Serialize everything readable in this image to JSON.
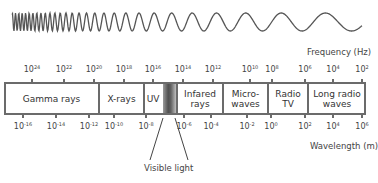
{
  "title_partial": "",
  "frequency_axis": {
    "label": "Frequency (Hz)",
    "ticks": [
      {
        "base": "10",
        "exp": "24",
        "x": 32
      },
      {
        "base": "10",
        "exp": "22",
        "x": 64
      },
      {
        "base": "10",
        "exp": "20",
        "x": 94
      },
      {
        "base": "10",
        "exp": "18",
        "x": 124
      },
      {
        "base": "10",
        "exp": "16",
        "x": 153
      },
      {
        "base": "10",
        "exp": "14",
        "x": 183
      },
      {
        "base": "10",
        "exp": "12",
        "x": 213
      },
      {
        "base": "10",
        "exp": "10",
        "x": 250
      },
      {
        "base": "10",
        "exp": "8",
        "x": 272
      },
      {
        "base": "10",
        "exp": "6",
        "x": 305
      },
      {
        "base": "10",
        "exp": "4",
        "x": 333
      },
      {
        "base": "10",
        "exp": "2",
        "x": 362
      }
    ]
  },
  "wavelength_axis": {
    "label": "Wavelength (m)",
    "ticks": [
      {
        "base": "10",
        "exp": "-16",
        "x": 23
      },
      {
        "base": "10",
        "exp": "-14",
        "x": 56
      },
      {
        "base": "10",
        "exp": "-12",
        "x": 89
      },
      {
        "base": "10",
        "exp": "-10",
        "x": 114
      },
      {
        "base": "10",
        "exp": "-8",
        "x": 146
      },
      {
        "base": "10",
        "exp": "-6",
        "x": 184
      },
      {
        "base": "10",
        "exp": "-4",
        "x": 211
      },
      {
        "base": "10",
        "exp": "-2",
        "x": 247
      },
      {
        "base": "10",
        "exp": "0",
        "x": 271
      },
      {
        "base": "10",
        "exp": "2",
        "x": 305
      },
      {
        "base": "10",
        "exp": "4",
        "x": 333
      },
      {
        "base": "10",
        "exp": "6",
        "x": 362
      }
    ]
  },
  "bands": [
    {
      "label": "Gamma rays",
      "left": 4,
      "right": 99
    },
    {
      "label": "X-rays",
      "left": 99,
      "right": 144
    },
    {
      "label": "UV",
      "left": 144,
      "right": 162
    },
    {
      "label": "Visible light",
      "left": 162,
      "right": 177
    },
    {
      "label": "Infared\nrays",
      "left": 177,
      "right": 223
    },
    {
      "label": "Micro-\nwaves",
      "left": 223,
      "right": 268
    },
    {
      "label": "Radio\nTV",
      "left": 268,
      "right": 308
    },
    {
      "label": "Long radio\nwaves",
      "left": 308,
      "right": 366
    }
  ],
  "callout": {
    "label": "Visible light"
  },
  "colors": {
    "line": "#6b6b6b",
    "text": "#333333",
    "wave": "#555555"
  }
}
